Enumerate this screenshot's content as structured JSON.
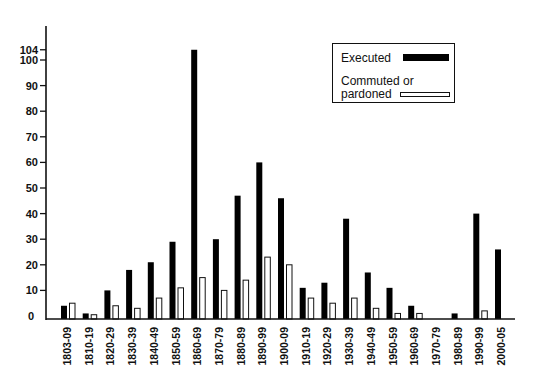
{
  "chart_data": {
    "type": "bar",
    "title": "",
    "xlabel": "",
    "ylabel": "",
    "ylim": [
      0,
      104
    ],
    "yticks": [
      0,
      10,
      20,
      30,
      40,
      50,
      60,
      70,
      80,
      90,
      100,
      104
    ],
    "grid": false,
    "legend_position": "upper right (inside)",
    "categories": [
      "1803-09",
      "1810-19",
      "1820-29",
      "1830-39",
      "1840-49",
      "1850-59",
      "1860-69",
      "1870-79",
      "1880-89",
      "1890-99",
      "1900-09",
      "1910-19",
      "1920-29",
      "1930-39",
      "1940-49",
      "1950-59",
      "1960-69",
      "1970-79",
      "1980-89",
      "1990-99",
      "2000-05"
    ],
    "series": [
      {
        "name": "Executed",
        "color": "#000000",
        "values": [
          4,
          1,
          10,
          18,
          21,
          29,
          104,
          30,
          47,
          60,
          46,
          11,
          13,
          38,
          17,
          11,
          4,
          0,
          1,
          40,
          26
        ]
      },
      {
        "name": "Commuted or pardoned",
        "color": "#ffffff",
        "values": [
          5,
          0.5,
          4,
          3,
          7,
          11,
          15,
          10,
          14,
          23,
          20,
          7,
          5,
          7,
          3,
          1,
          1,
          0,
          0,
          2,
          0
        ]
      }
    ]
  },
  "legend": {
    "executed_label": "Executed",
    "commuted_label_line1": "Commuted or",
    "commuted_label_line2": "pardoned"
  }
}
